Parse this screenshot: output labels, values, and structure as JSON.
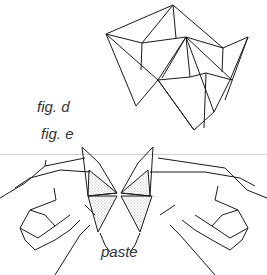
{
  "figure": {
    "labels": {
      "fig_d": "fig. d",
      "fig_e": "fig. e",
      "paste": "paste"
    },
    "colors": {
      "line": "#1a1a1a",
      "background": "#ffffff",
      "stipple": "#777777",
      "divider": "#d0d0d0"
    }
  }
}
